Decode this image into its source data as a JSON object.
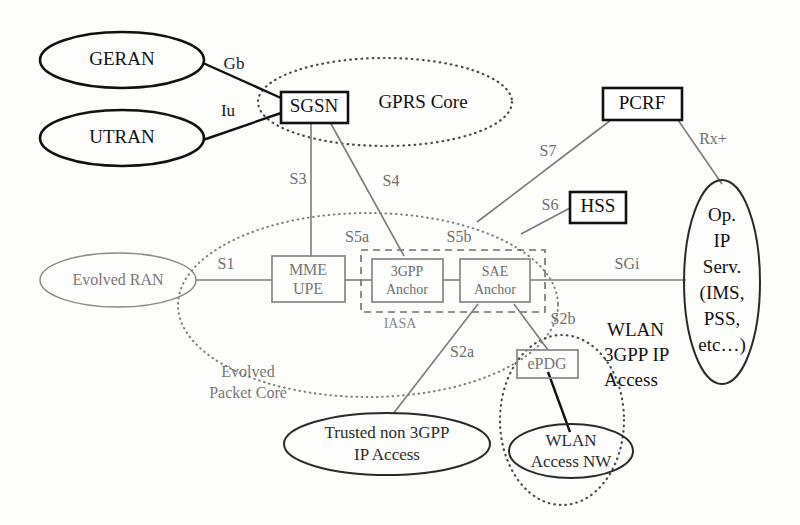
{
  "diagram": {
    "nodes": {
      "geran": "GERAN",
      "utran": "UTRAN",
      "sgsn": "SGSN",
      "evolved_ran": "Evolved RAN",
      "mme_upe_line1": "MME",
      "mme_upe_line2": "UPE",
      "anchor3gpp_line1": "3GPP",
      "anchor3gpp_line2": "Anchor",
      "sae_anchor_line1": "SAE",
      "sae_anchor_line2": "Anchor",
      "pcrf": "PCRF",
      "hss": "HSS",
      "epdg": "ePDG",
      "trusted_line1": "Trusted non 3GPP",
      "trusted_line2": "IP Access",
      "wlan_access_line1": "WLAN",
      "wlan_access_line2": "Access NW",
      "op_ip_serv_line1": "Op.",
      "op_ip_serv_line2": "IP",
      "op_ip_serv_line3": "Serv.",
      "op_ip_serv_line4": "(IMS,",
      "op_ip_serv_line5": "PSS,",
      "op_ip_serv_line6": "etc…)"
    },
    "domains": {
      "gprs_core": "GPRS  Core",
      "evolved_packet_core_line1": "Evolved",
      "evolved_packet_core_line2": "Packet Core",
      "iasa": "IASA",
      "wlan_3gpp_line1": "WLAN",
      "wlan_3gpp_line2": "3GPP IP",
      "wlan_3gpp_line3": "Access"
    },
    "interfaces": {
      "gb": "Gb",
      "iu": "Iu",
      "s1": "S1",
      "s3": "S3",
      "s4": "S4",
      "s5a": "S5a",
      "s5b": "S5b",
      "s6": "S6",
      "s7": "S7",
      "s2a": "S2a",
      "s2b": "S2b",
      "sgi": "SGi",
      "rx_plus": "Rx+"
    },
    "colors": {
      "background": "#fdfdfc",
      "stroke_dark": "#111111",
      "stroke_grey": "#7c7c7c",
      "stroke_dotted": "#4a4a4a"
    }
  }
}
